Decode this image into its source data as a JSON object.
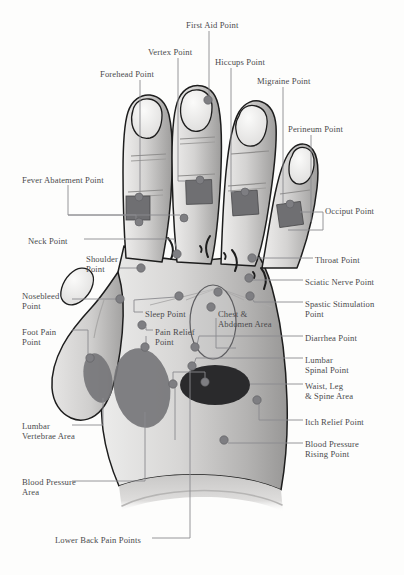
{
  "diagram": {
    "background_color": "#fdfdfc",
    "label_text_color": "#4a4a4c",
    "leader_line_color": "#8a8a8e",
    "point_marker_color": "#7e7e82",
    "skin_light_color": "#e8e7e6",
    "skin_mid_color": "#b9b8b7",
    "skin_dark_color": "#8e8d8c",
    "outline_color": "#1d1d1d",
    "patch_color": "#6f6f72",
    "zone_mid_color": "#767679",
    "zone_dark_color": "#2a2a2c"
  },
  "labels": [
    {
      "id": "first-aid-point",
      "text": "First Aid Point",
      "x": 186,
      "y": 20,
      "align": "left"
    },
    {
      "id": "vertex-point",
      "text": "Vertex Point",
      "x": 148,
      "y": 47,
      "align": "left"
    },
    {
      "id": "hiccups-point",
      "text": "Hiccups Point",
      "x": 215,
      "y": 57,
      "align": "left"
    },
    {
      "id": "forehead-point",
      "text": "Forehead Point",
      "x": 100,
      "y": 69,
      "align": "left"
    },
    {
      "id": "migraine-point",
      "text": "Migraine Point",
      "x": 257,
      "y": 76,
      "align": "left"
    },
    {
      "id": "perineum-point",
      "text": "Perineum Point",
      "x": 288,
      "y": 124,
      "align": "left"
    },
    {
      "id": "fever-abatement-point",
      "text": "Fever Abatement Point",
      "x": 22,
      "y": 175,
      "align": "left"
    },
    {
      "id": "occiput-point",
      "text": "Occiput Point",
      "x": 325,
      "y": 206,
      "align": "left"
    },
    {
      "id": "neck-point",
      "text": "Neck Point",
      "x": 28,
      "y": 236,
      "align": "left"
    },
    {
      "id": "shoulder-point",
      "text": "Shoulder\nPoint",
      "x": 86,
      "y": 254,
      "align": "left"
    },
    {
      "id": "throat-point",
      "text": "Throat Point",
      "x": 315,
      "y": 255,
      "align": "left"
    },
    {
      "id": "sciatic-nerve-point",
      "text": "Sciatic Nerve Point",
      "x": 305,
      "y": 277,
      "align": "left"
    },
    {
      "id": "nosebleed-point",
      "text": "Nosebleed\nPoint",
      "x": 22,
      "y": 291,
      "align": "left"
    },
    {
      "id": "spastic-stimulation-point",
      "text": "Spastic Stimulation\nPoint",
      "x": 305,
      "y": 299,
      "align": "left"
    },
    {
      "id": "sleep-point",
      "text": "Sleep Point",
      "x": 145,
      "y": 309,
      "align": "left"
    },
    {
      "id": "chest-abdomen-area",
      "text": "Chest &\nAbdomen Area",
      "x": 218,
      "y": 309,
      "align": "left"
    },
    {
      "id": "foot-pain-point",
      "text": "Foot Pain\nPoint",
      "x": 22,
      "y": 327,
      "align": "left"
    },
    {
      "id": "pain-relief-point",
      "text": "Pain Relief\nPoint",
      "x": 155,
      "y": 327,
      "align": "left"
    },
    {
      "id": "diarrhea-point",
      "text": "Diarrhea Point",
      "x": 305,
      "y": 333,
      "align": "left"
    },
    {
      "id": "lumbar-spinal-point",
      "text": "Lumbar\nSpinal Point",
      "x": 305,
      "y": 355,
      "align": "left"
    },
    {
      "id": "waist-leg-spine-area",
      "text": "Waist, Leg\n& Spine Area",
      "x": 305,
      "y": 381,
      "align": "left"
    },
    {
      "id": "itch-relief-point",
      "text": "Itch Relief Point",
      "x": 305,
      "y": 417,
      "align": "left"
    },
    {
      "id": "lumbar-vertebrae-area",
      "text": "Lumbar\nVertebrae Area",
      "x": 22,
      "y": 421,
      "align": "left"
    },
    {
      "id": "blood-pressure-rising-point",
      "text": "Blood Pressure\nRising Point",
      "x": 305,
      "y": 439,
      "align": "left"
    },
    {
      "id": "blood-pressure-area",
      "text": "Blood Pressure\nArea",
      "x": 22,
      "y": 477,
      "align": "left"
    },
    {
      "id": "lower-back-pain-points",
      "text": "Lower Back Pain Points",
      "x": 55,
      "y": 535,
      "align": "left"
    }
  ],
  "points": [
    {
      "id": "first-aid-marker",
      "x": 208,
      "y": 100,
      "r": 4.2
    },
    {
      "id": "vertex-marker",
      "x": 200,
      "y": 180,
      "r": 4.0
    },
    {
      "id": "hiccups-marker",
      "x": 245,
      "y": 192,
      "r": 4.0
    },
    {
      "id": "forehead-marker",
      "x": 139,
      "y": 197,
      "r": 4.0
    },
    {
      "id": "migraine-marker",
      "x": 290,
      "y": 204,
      "r": 4.0
    },
    {
      "id": "fever-marker",
      "x": 184,
      "y": 218,
      "r": 4.0
    },
    {
      "id": "fever-marker-2",
      "x": 139,
      "y": 222,
      "r": 4.0
    },
    {
      "id": "neck-marker",
      "x": 177,
      "y": 254,
      "r": 4.2
    },
    {
      "id": "shoulder-marker",
      "x": 141,
      "y": 268,
      "r": 4.2
    },
    {
      "id": "throat-marker",
      "x": 252,
      "y": 258,
      "r": 4.2
    },
    {
      "id": "sciatic-marker",
      "x": 249,
      "y": 278,
      "r": 4.2
    },
    {
      "id": "sleep-marker",
      "x": 179,
      "y": 296,
      "r": 4.2
    },
    {
      "id": "spastic-marker",
      "x": 250,
      "y": 296,
      "r": 4.2
    },
    {
      "id": "chest-top-marker",
      "x": 218,
      "y": 292,
      "r": 4.2
    },
    {
      "id": "chest-mid-marker",
      "x": 211,
      "y": 307,
      "r": 4.2
    },
    {
      "id": "nosebleed-marker",
      "x": 120,
      "y": 299,
      "r": 4.2
    },
    {
      "id": "pain-relief-marker",
      "x": 142,
      "y": 325,
      "r": 4.2
    },
    {
      "id": "pain-relief-marker2",
      "x": 145,
      "y": 347,
      "r": 4.2
    },
    {
      "id": "diarrhea-marker",
      "x": 195,
      "y": 347,
      "r": 4.2
    },
    {
      "id": "foot-pain-marker",
      "x": 90,
      "y": 358,
      "r": 4.2
    },
    {
      "id": "lumbar-spinal-marker",
      "x": 192,
      "y": 366,
      "r": 4.2
    },
    {
      "id": "waist-marker-a",
      "x": 173,
      "y": 384,
      "r": 4.2
    },
    {
      "id": "waist-marker-b",
      "x": 205,
      "y": 382,
      "r": 4.2
    },
    {
      "id": "itch-relief-marker",
      "x": 257,
      "y": 400,
      "r": 4.2
    },
    {
      "id": "bp-rising-marker",
      "x": 224,
      "y": 440,
      "r": 4.2
    }
  ],
  "zones": [
    {
      "id": "chest-abdomen-oval",
      "cx": 213,
      "cy": 322,
      "rx": 23,
      "ry": 37,
      "tone": "outline"
    },
    {
      "id": "lumbar-vertebrae-oval",
      "cx": 98,
      "cy": 378,
      "rx": 14,
      "ry": 25,
      "tone": "mid"
    },
    {
      "id": "blood-pressure-oval",
      "cx": 142,
      "cy": 388,
      "rx": 28,
      "ry": 40,
      "tone": "mid"
    },
    {
      "id": "waist-leg-spine-oval",
      "cx": 215,
      "cy": 385,
      "rx": 35,
      "ry": 20,
      "tone": "dark"
    }
  ],
  "finger_patches": [
    {
      "id": "forehead-patch",
      "x": 126,
      "y": 196,
      "w": 24,
      "h": 24
    },
    {
      "id": "vertex-patch",
      "x": 186,
      "y": 180,
      "w": 26,
      "h": 24
    },
    {
      "id": "hiccups-patch",
      "x": 232,
      "y": 191,
      "w": 26,
      "h": 24
    },
    {
      "id": "migraine-patch",
      "x": 278,
      "y": 203,
      "w": 24,
      "h": 23
    }
  ]
}
